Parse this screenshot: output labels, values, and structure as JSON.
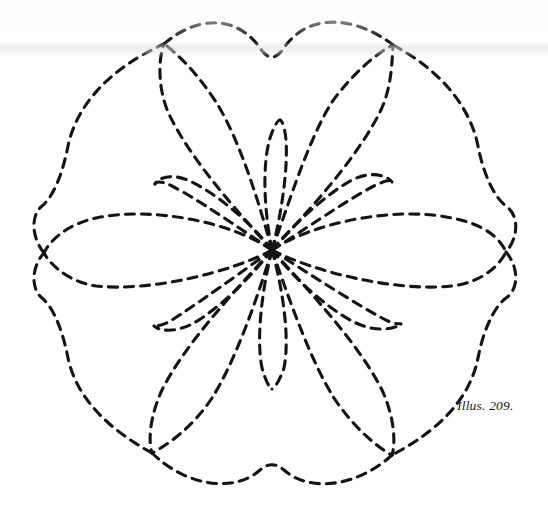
{
  "page": {
    "width": 548,
    "height": 505,
    "background_color": "#ffffff",
    "ink_color": "#141414"
  },
  "caption": {
    "text": "Illus. 209.",
    "style": "italic-serif"
  },
  "figure": {
    "name": "dashed-floral-quilting-motif",
    "center": {
      "x": 272,
      "y": 250
    },
    "stroke": {
      "color": "#141414",
      "width": 3.1,
      "dash_length": 9,
      "gap_length": 7,
      "linecap": "round"
    },
    "cusps": [
      {
        "name": "cusp-top-left",
        "x": 164,
        "y": 44
      },
      {
        "name": "cusp-top-right",
        "x": 393,
        "y": 45
      },
      {
        "name": "cusp-bottom-right",
        "x": 392,
        "y": 455
      },
      {
        "name": "cusp-bottom-left",
        "x": 152,
        "y": 453
      }
    ],
    "petal_tips": [
      {
        "name": "petal-tip-left",
        "x": 44,
        "y": 253
      },
      {
        "name": "petal-tip-right",
        "x": 506,
        "y": 252
      },
      {
        "name": "petal-tip-upper-left",
        "x": 164,
        "y": 44
      },
      {
        "name": "petal-tip-upper-right",
        "x": 393,
        "y": 45
      },
      {
        "name": "petal-tip-lower-left",
        "x": 152,
        "y": 453
      },
      {
        "name": "petal-tip-lower-right",
        "x": 392,
        "y": 455
      }
    ],
    "inner_petal_tips": [
      {
        "name": "inner-tip-up",
        "x": 280,
        "y": 120
      },
      {
        "name": "inner-tip-down",
        "x": 272,
        "y": 389
      },
      {
        "name": "inner-tip-upper-left",
        "x": 155,
        "y": 184
      },
      {
        "name": "inner-tip-upper-right",
        "x": 392,
        "y": 182
      },
      {
        "name": "inner-tip-lower-left",
        "x": 154,
        "y": 326
      },
      {
        "name": "inner-tip-lower-right",
        "x": 401,
        "y": 324
      }
    ],
    "counts": {
      "large_petals": 6,
      "inner_petals": 6,
      "outline_cusps": 4
    }
  }
}
